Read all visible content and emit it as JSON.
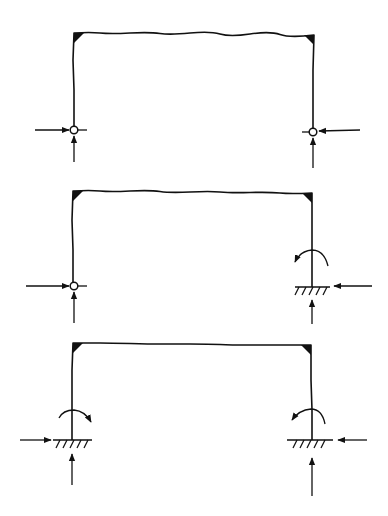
{
  "diagram": {
    "colors": {
      "line": "#111111",
      "background": "#ffffff"
    },
    "frames": [
      {
        "id": "frame-1",
        "supports": {
          "left": "pin",
          "right": "pin"
        },
        "reactions": {
          "left": [
            "horizontal",
            "vertical"
          ],
          "right": [
            "horizontal",
            "vertical"
          ]
        }
      },
      {
        "id": "frame-2",
        "supports": {
          "left": "pin",
          "right": "fixed"
        },
        "reactions": {
          "left": [
            "horizontal",
            "vertical"
          ],
          "right": [
            "horizontal",
            "vertical",
            "moment"
          ]
        }
      },
      {
        "id": "frame-3",
        "supports": {
          "left": "fixed",
          "right": "fixed"
        },
        "reactions": {
          "left": [
            "horizontal",
            "vertical",
            "moment"
          ],
          "right": [
            "horizontal",
            "vertical",
            "moment"
          ]
        }
      }
    ]
  }
}
